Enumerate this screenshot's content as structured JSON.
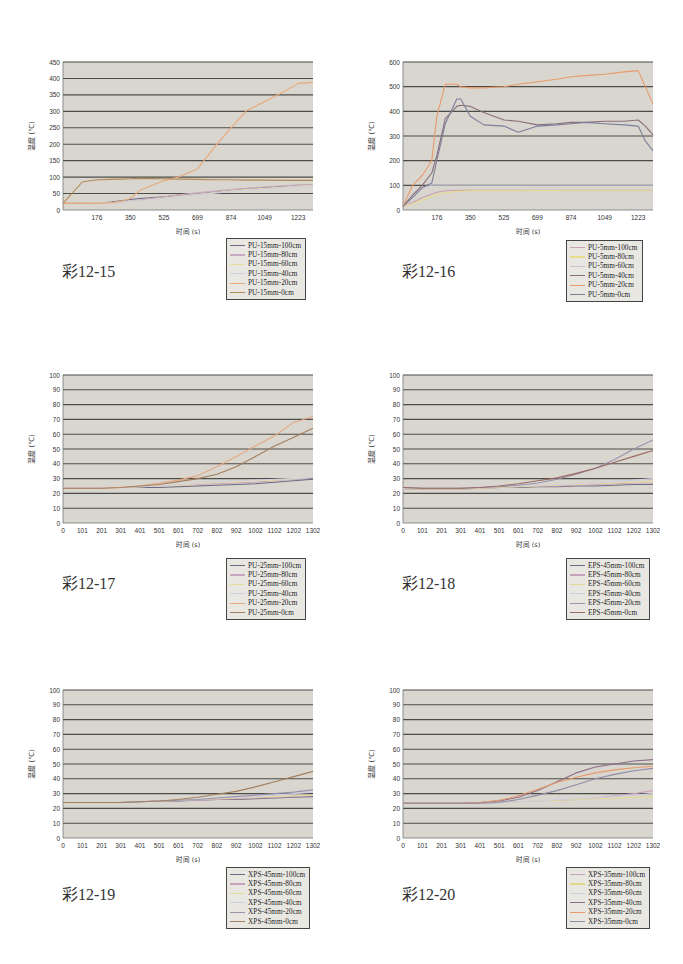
{
  "chart_data": [
    {
      "id": "c12-15",
      "type": "line",
      "caption": "彩12-15",
      "title": "",
      "xlabel": "时间  (s)",
      "ylabel": "温度 (℃)",
      "ylim": [
        0,
        450
      ],
      "yticks": [
        0,
        50,
        100,
        150,
        200,
        250,
        300,
        350,
        400,
        450
      ],
      "xlim": [
        0,
        1300
      ],
      "xticks": [
        176,
        350,
        525,
        699,
        874,
        1049,
        1223
      ],
      "grid": true,
      "legend_position": "below-right",
      "x": [
        0,
        100,
        176,
        250,
        300,
        350,
        400,
        525,
        600,
        699,
        800,
        874,
        950,
        1049,
        1150,
        1223,
        1300
      ],
      "series": [
        {
          "name": "PU-15mm-100cm",
          "color": "#6e6a86",
          "values": [
            20,
            20,
            20,
            24,
            28,
            32,
            35,
            40,
            45,
            50,
            55,
            60,
            64,
            68,
            72,
            75,
            76
          ]
        },
        {
          "name": "PU-15mm-80cm",
          "color": "#c9a9c2",
          "values": [
            20,
            20,
            20,
            22,
            24,
            27,
            30,
            40,
            46,
            52,
            58,
            62,
            66,
            70,
            74,
            76,
            77
          ]
        },
        {
          "name": "PU-15mm-60cm",
          "color": "#e8dd9a",
          "values": [
            20,
            20,
            21,
            22,
            24,
            26,
            28,
            36,
            42,
            48,
            54,
            58,
            62,
            66,
            70,
            73,
            75
          ]
        },
        {
          "name": "PU-15mm-40cm",
          "color": "#cfcfe0",
          "values": [
            20,
            20,
            21,
            22,
            24,
            26,
            28,
            34,
            40,
            46,
            52,
            56,
            60,
            64,
            68,
            71,
            73
          ]
        },
        {
          "name": "PU-15mm-20cm",
          "color": "#e8a878",
          "values": [
            20,
            20,
            20,
            22,
            26,
            35,
            60,
            90,
            100,
            125,
            200,
            250,
            300,
            330,
            360,
            385,
            388
          ]
        },
        {
          "name": "PU-15mm-0cm",
          "color": "#b08a55",
          "values": [
            20,
            85,
            92,
            93,
            94,
            95,
            96,
            95,
            94,
            93,
            92,
            92,
            91,
            91,
            90,
            90,
            90
          ]
        }
      ]
    },
    {
      "id": "c12-16",
      "type": "line",
      "caption": "彩12-16",
      "title": "",
      "xlabel": "时间  (s)",
      "ylabel": "温度 (℃)",
      "ylim": [
        0,
        600
      ],
      "yticks": [
        0,
        100,
        200,
        300,
        400,
        500,
        600
      ],
      "xlim": [
        0,
        1300
      ],
      "xticks": [
        176,
        350,
        525,
        699,
        874,
        1049,
        1223
      ],
      "grid": true,
      "legend_position": "below-right",
      "x": [
        0,
        50,
        100,
        150,
        176,
        220,
        280,
        300,
        350,
        420,
        525,
        600,
        699,
        800,
        874,
        950,
        1049,
        1150,
        1223,
        1260,
        1300
      ],
      "series": [
        {
          "name": "PU-5mm-100cm",
          "color": "#c9a0b4",
          "values": [
            15,
            30,
            50,
            65,
            72,
            78,
            80,
            80,
            80,
            80,
            80,
            80,
            80,
            80,
            80,
            80,
            80,
            80,
            80,
            80,
            80
          ]
        },
        {
          "name": "PU-5mm-80cm",
          "color": "#e6dc8c",
          "values": [
            15,
            25,
            40,
            55,
            62,
            70,
            75,
            76,
            78,
            78,
            78,
            78,
            79,
            79,
            80,
            80,
            80,
            80,
            80,
            80,
            80
          ]
        },
        {
          "name": "PU-5mm-60cm",
          "color": "#c7c4d8",
          "values": [
            15,
            60,
            90,
            100,
            100,
            100,
            100,
            100,
            100,
            100,
            100,
            100,
            100,
            100,
            100,
            100,
            100,
            100,
            100,
            100,
            100
          ]
        },
        {
          "name": "PU-5mm-40cm",
          "color": "#8a6e78",
          "values": [
            15,
            60,
            100,
            150,
            220,
            370,
            420,
            425,
            420,
            395,
            365,
            360,
            345,
            350,
            355,
            355,
            360,
            360,
            365,
            340,
            305
          ]
        },
        {
          "name": "PU-5mm-20cm",
          "color": "#e89a6a",
          "values": [
            15,
            100,
            140,
            200,
            380,
            510,
            510,
            500,
            495,
            495,
            500,
            510,
            520,
            530,
            540,
            545,
            550,
            560,
            565,
            500,
            430
          ]
        },
        {
          "name": "PU-5mm-0cm",
          "color": "#7c7f9a",
          "values": [
            15,
            50,
            90,
            110,
            200,
            350,
            450,
            450,
            380,
            345,
            340,
            315,
            340,
            345,
            350,
            355,
            350,
            345,
            340,
            280,
            240
          ]
        }
      ]
    },
    {
      "id": "c12-17",
      "type": "line",
      "caption": "彩12-17",
      "title": "",
      "xlabel": "时间  (s)",
      "ylabel": "温度 (℃)",
      "ylim": [
        0,
        100
      ],
      "yticks": [
        0,
        10,
        20,
        30,
        40,
        50,
        60,
        70,
        80,
        90,
        100
      ],
      "xlim": [
        0,
        1302
      ],
      "xticks": [
        0,
        101,
        201,
        301,
        401,
        501,
        601,
        702,
        802,
        902,
        1002,
        1102,
        1202,
        1302
      ],
      "grid": true,
      "legend_position": "below-right",
      "x": [
        0,
        101,
        201,
        301,
        401,
        501,
        601,
        702,
        802,
        902,
        1002,
        1102,
        1202,
        1302
      ],
      "series": [
        {
          "name": "PU-25mm-100cm",
          "color": "#6b6a82",
          "values": [
            24,
            24,
            24,
            24,
            24,
            24,
            24.5,
            25,
            25.5,
            26,
            26.5,
            27.5,
            28.5,
            29.5
          ]
        },
        {
          "name": "PU-25mm-80cm",
          "color": "#c9a6bf",
          "values": [
            24,
            24,
            24,
            24,
            24.5,
            25,
            25.5,
            26,
            26.5,
            27,
            27.5,
            28.5,
            29.5,
            30.5
          ]
        },
        {
          "name": "PU-25mm-60cm",
          "color": "#e5dd9c",
          "values": [
            24,
            24,
            24,
            24,
            24.5,
            25,
            25.5,
            26.5,
            27.5,
            28,
            28.5,
            29,
            30,
            31
          ]
        },
        {
          "name": "PU-25mm-40cm",
          "color": "#d0cfe0",
          "values": [
            24,
            24,
            24,
            24,
            24.5,
            25,
            26,
            27,
            28,
            28.5,
            29,
            29.5,
            30,
            31
          ]
        },
        {
          "name": "PU-25mm-20cm",
          "color": "#e4a882",
          "values": [
            23.5,
            23.5,
            23.5,
            24,
            25,
            27,
            29,
            32,
            38,
            45,
            52,
            59,
            68,
            72
          ]
        },
        {
          "name": "PU-25mm-0cm",
          "color": "#a27f5e",
          "values": [
            23.5,
            23.5,
            23.5,
            24,
            25,
            26,
            28,
            30,
            33,
            38,
            45,
            52,
            58,
            64
          ]
        }
      ]
    },
    {
      "id": "c12-18",
      "type": "line",
      "caption": "彩12-18",
      "title": "",
      "xlabel": "时间  (s)",
      "ylabel": "温度 (℃)",
      "ylim": [
        0,
        100
      ],
      "yticks": [
        0,
        10,
        20,
        30,
        40,
        50,
        60,
        70,
        80,
        90,
        100
      ],
      "xlim": [
        0,
        1302
      ],
      "xticks": [
        0,
        101,
        201,
        301,
        401,
        501,
        601,
        702,
        802,
        902,
        1002,
        1102,
        1202,
        1302
      ],
      "grid": true,
      "legend_position": "below-right",
      "x": [
        0,
        101,
        201,
        301,
        401,
        501,
        601,
        702,
        802,
        902,
        1002,
        1102,
        1202,
        1302
      ],
      "series": [
        {
          "name": "EPS-45mm-100cm",
          "color": "#6d6b84",
          "values": [
            23,
            23,
            23,
            23,
            23.5,
            24,
            24,
            24.5,
            24.5,
            25,
            25,
            25.5,
            26,
            26
          ]
        },
        {
          "name": "EPS-45mm-80cm",
          "color": "#c7a3bb",
          "values": [
            23,
            23,
            23,
            23,
            23.5,
            24,
            24.5,
            25,
            25,
            25.5,
            26,
            26.5,
            27,
            27
          ]
        },
        {
          "name": "EPS-45mm-60cm",
          "color": "#e3da98",
          "values": [
            23,
            23,
            23,
            23,
            23.5,
            24,
            24.5,
            25,
            25.5,
            26,
            26.5,
            27,
            27.5,
            28
          ]
        },
        {
          "name": "EPS-45mm-40cm",
          "color": "#cfcee0",
          "values": [
            23.5,
            23.5,
            23.5,
            23.5,
            24,
            24.5,
            25,
            25.5,
            26,
            26.5,
            27,
            28,
            29,
            30
          ]
        },
        {
          "name": "EPS-45mm-20cm",
          "color": "#9a93ad",
          "values": [
            24,
            23.5,
            23.5,
            23.5,
            24,
            24.5,
            25.5,
            27,
            29.5,
            33,
            37,
            43,
            50,
            56
          ]
        },
        {
          "name": "EPS-45mm-0cm",
          "color": "#9a6a62",
          "values": [
            24,
            23.5,
            23.5,
            23.5,
            24,
            25,
            26.5,
            28.5,
            30.5,
            33.5,
            37,
            41,
            45,
            49
          ]
        }
      ]
    },
    {
      "id": "c12-19",
      "type": "line",
      "caption": "彩12-19",
      "title": "",
      "xlabel": "时间  (s)",
      "ylabel": "温度 (℃)",
      "ylim": [
        0,
        100
      ],
      "yticks": [
        0,
        10,
        20,
        30,
        40,
        50,
        60,
        70,
        80,
        90,
        100
      ],
      "xlim": [
        0,
        1302
      ],
      "xticks": [
        0,
        101,
        201,
        301,
        401,
        501,
        601,
        702,
        802,
        902,
        1002,
        1102,
        1202,
        1302
      ],
      "grid": true,
      "legend_position": "below-right",
      "x": [
        0,
        101,
        201,
        301,
        401,
        501,
        601,
        702,
        802,
        902,
        1002,
        1102,
        1202,
        1302
      ],
      "series": [
        {
          "name": "XPS-45mm-100cm",
          "color": "#6d6b84",
          "values": [
            24,
            24,
            24,
            24,
            24.5,
            25,
            25,
            25.5,
            26,
            26,
            26.5,
            27,
            27.5,
            28
          ]
        },
        {
          "name": "XPS-45mm-80cm",
          "color": "#c7a3bb",
          "values": [
            24,
            24,
            24,
            24,
            24.5,
            25,
            25.5,
            25.5,
            26,
            26.5,
            27,
            27.5,
            28,
            28.5
          ]
        },
        {
          "name": "XPS-45mm-60cm",
          "color": "#e3da98",
          "values": [
            24,
            24,
            24,
            24,
            24.5,
            25,
            25.5,
            26,
            26.5,
            27,
            27.5,
            28,
            28.5,
            29
          ]
        },
        {
          "name": "XPS-45mm-40cm",
          "color": "#cfcee0",
          "values": [
            24,
            24,
            24,
            24,
            24.5,
            25,
            25.5,
            26,
            27,
            27.5,
            28,
            29,
            30,
            31
          ]
        },
        {
          "name": "XPS-45mm-20cm",
          "color": "#9a93ad",
          "values": [
            24,
            24,
            24,
            24,
            24.5,
            25,
            25.5,
            26,
            27,
            28,
            29,
            30,
            31,
            32.5
          ]
        },
        {
          "name": "XPS-45mm-0cm",
          "color": "#a27f5e",
          "values": [
            24,
            24,
            24,
            24,
            24.5,
            25,
            26,
            27.5,
            29.5,
            31.5,
            34.5,
            38,
            41.5,
            45
          ]
        }
      ]
    },
    {
      "id": "c12-20",
      "type": "line",
      "caption": "彩12-20",
      "title": "",
      "xlabel": "时间  (s)",
      "ylabel": "温度 (℃)",
      "ylim": [
        0,
        100
      ],
      "yticks": [
        0,
        10,
        20,
        30,
        40,
        50,
        60,
        70,
        80,
        90,
        100
      ],
      "xlim": [
        0,
        1302
      ],
      "xticks": [
        0,
        101,
        201,
        301,
        401,
        501,
        601,
        702,
        802,
        902,
        1002,
        1102,
        1202,
        1302
      ],
      "grid": true,
      "legend_position": "below-right",
      "x": [
        0,
        101,
        201,
        301,
        401,
        501,
        601,
        702,
        802,
        902,
        1002,
        1102,
        1202,
        1302
      ],
      "series": [
        {
          "name": "XPS-35mm-100cm",
          "color": "#c9a6bf",
          "values": [
            23.5,
            23.5,
            23.5,
            23.5,
            23.5,
            24,
            24.5,
            25,
            25.5,
            26,
            27,
            28.5,
            30,
            32
          ]
        },
        {
          "name": "XPS-35mm-80cm",
          "color": "#e3d98e",
          "values": [
            23.5,
            23.5,
            23.5,
            23.5,
            23.5,
            24,
            24.5,
            25,
            25.5,
            26,
            26.5,
            27,
            27.5,
            28
          ]
        },
        {
          "name": "XPS-35mm-60cm",
          "color": "#cfcee0",
          "values": [
            23.5,
            23.5,
            23.5,
            23.5,
            23.5,
            24,
            24.5,
            25,
            26,
            26.5,
            27,
            28,
            29,
            30
          ]
        },
        {
          "name": "XPS-35mm-40cm",
          "color": "#8c6e8a",
          "values": [
            23.5,
            23.5,
            23.5,
            23.5,
            24,
            25,
            27.5,
            32,
            38,
            44,
            48,
            50,
            52,
            53
          ]
        },
        {
          "name": "XPS-35mm-20cm",
          "color": "#e89a6a",
          "values": [
            23.5,
            23.5,
            23.5,
            23.5,
            24,
            25.5,
            28.5,
            33,
            37.5,
            41,
            44,
            46,
            47.5,
            48.5
          ]
        },
        {
          "name": "XPS-35mm-0cm",
          "color": "#8e8ca6",
          "values": [
            23.5,
            23.5,
            23.5,
            23.5,
            23.5,
            24,
            26,
            29,
            32,
            36,
            40,
            43,
            45.5,
            47
          ]
        }
      ]
    }
  ],
  "layout": {
    "panels": [
      {
        "x": 20,
        "y": 55,
        "legend_x": 226,
        "legend_y": 238,
        "caption_x": 62,
        "caption_y": 258
      },
      {
        "x": 360,
        "y": 55,
        "legend_x": 566,
        "legend_y": 240,
        "caption_x": 402,
        "caption_y": 258
      },
      {
        "x": 20,
        "y": 368,
        "legend_x": 226,
        "legend_y": 558,
        "caption_x": 62,
        "caption_y": 570
      },
      {
        "x": 360,
        "y": 368,
        "legend_x": 566,
        "legend_y": 558,
        "caption_x": 402,
        "caption_y": 570
      },
      {
        "x": 20,
        "y": 683,
        "legend_x": 226,
        "legend_y": 867,
        "caption_x": 62,
        "caption_y": 881
      },
      {
        "x": 360,
        "y": 683,
        "legend_x": 566,
        "legend_y": 867,
        "caption_x": 402,
        "caption_y": 881
      }
    ]
  }
}
